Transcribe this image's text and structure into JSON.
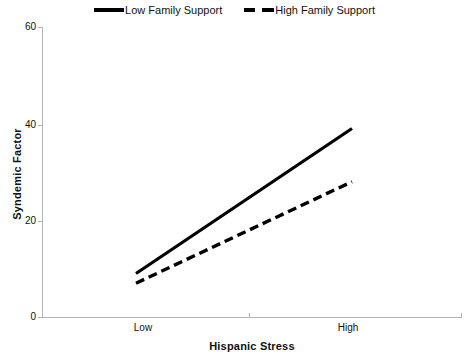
{
  "chart_data": {
    "type": "line",
    "title": "",
    "xlabel": "Hispanic Stress",
    "ylabel": "Syndemic Factor",
    "categories": [
      "Low",
      "High"
    ],
    "x": [
      0,
      1
    ],
    "xlim": [
      0,
      1
    ],
    "ylim": [
      0,
      60
    ],
    "yticks": [
      0,
      20,
      40,
      60
    ],
    "xticks": [
      "Low",
      "High"
    ],
    "grid": false,
    "legend_position": "top-center",
    "series": [
      {
        "name": "Low Family Support",
        "style": "solid",
        "color": "#000000",
        "values": [
          9,
          39
        ]
      },
      {
        "name": "High Family Support",
        "style": "dashed",
        "color": "#000000",
        "values": [
          7,
          28
        ]
      }
    ]
  },
  "legend": {
    "entries": [
      {
        "label": "Low Family Support",
        "marker": "solid-line-swatch"
      },
      {
        "label": "High Family Support",
        "marker": "dashed-line-swatch"
      }
    ]
  },
  "axes": {
    "y": {
      "title": "Syndemic Factor",
      "ticks": [
        "0",
        "20",
        "40",
        "60"
      ]
    },
    "x": {
      "title": "Hispanic Stress",
      "ticks": [
        "Low",
        "High"
      ]
    }
  }
}
